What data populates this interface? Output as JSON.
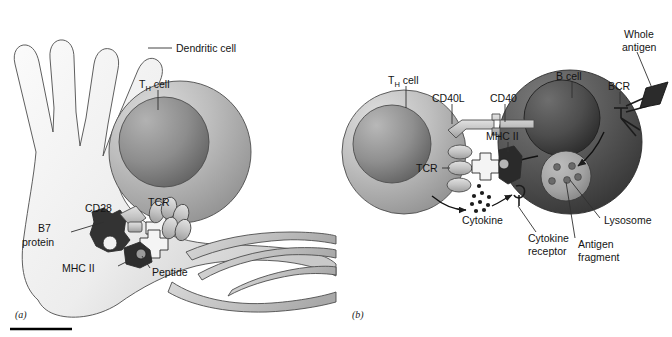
{
  "figure": {
    "panels": [
      {
        "id": "a",
        "caption": "(a)",
        "labels": {
          "dendritic_cell": "Dendritic cell",
          "th_cell_main": "T",
          "th_cell_sub": "H",
          "th_cell_tail": " cell",
          "cd28": "CD28",
          "tcr": "TCR",
          "b7_line1": "B7",
          "b7_line2": "protein",
          "mhc2": "MHC II",
          "peptide": "Peptide"
        }
      },
      {
        "id": "b",
        "caption": "(b)",
        "labels": {
          "th_cell_main": "T",
          "th_cell_sub": "H",
          "th_cell_tail": " cell",
          "cd40l": "CD40L",
          "cd40": "CD40",
          "mhc2": "MHC II",
          "tcr": "TCR",
          "b_cell": "B cell",
          "whole_antigen_line1": "Whole",
          "whole_antigen_line2": "antigen",
          "bcr": "BCR",
          "cytokine": "Cytokine",
          "cytokine_receptor_line1": "Cytokine",
          "cytokine_receptor_line2": "receptor",
          "lysosome": "Lysosome",
          "antigen_fragment_line1": "Antigen",
          "antigen_fragment_line2": "fragment"
        }
      }
    ],
    "colors": {
      "background": "#ffffff",
      "dendritic_cell_light": "#e8e8e8",
      "dendritic_cell_mid": "#b9b9b9",
      "th_cell_light": "#d2d2d2",
      "th_cell_mid": "#9c9c9c",
      "th_nucleus_dark": "#6f6f6f",
      "b_cell_dark": "#5d5d5d",
      "b_cell_darker": "#3d3d3d",
      "b_nucleus": "#4a4a4a",
      "receptor_gray": "#c3c3c3",
      "mhc_dark": "#2e2e2e",
      "b7_dark": "#333333",
      "lysosome_gray": "#a8a8a8",
      "text": "#141414",
      "leader_line": "#303030",
      "rule": "#000000"
    },
    "rule": {
      "present": true
    }
  }
}
